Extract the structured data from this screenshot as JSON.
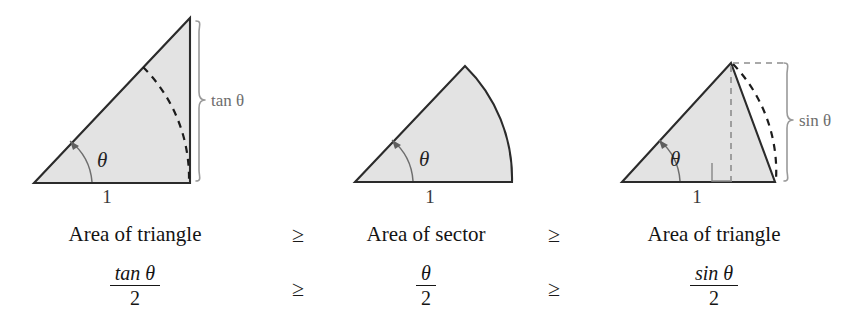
{
  "figure": {
    "title_row": [
      "Area of triangle",
      "Area of sector",
      "Area of triangle"
    ],
    "relations": [
      "≥",
      "≥",
      "≥",
      "≥"
    ],
    "colors": {
      "shape_fill": "#e3e3e3",
      "shape_stroke": "#2b2b2b",
      "brace": "#9a9a9a",
      "dashed_dark": "#1c1c1c",
      "dashed_light": "#8d8d8d",
      "text": "#141414",
      "background": "#ffffff"
    }
  },
  "panels": [
    {
      "id": "tangent-triangle",
      "caption": "Area of triangle",
      "formula": {
        "numerator": "tan θ",
        "denominator": "2"
      },
      "angle_label": "θ",
      "base_label": "1",
      "side_label": "tan θ",
      "shape": "right-triangle-with-unit-arc"
    },
    {
      "id": "circular-sector",
      "caption": "Area of sector",
      "formula": {
        "numerator": "θ",
        "denominator": "2"
      },
      "angle_label": "θ",
      "base_label": "1",
      "side_label": "",
      "shape": "circular-sector"
    },
    {
      "id": "sine-triangle",
      "caption": "Area of triangle",
      "formula": {
        "numerator": "sin θ",
        "denominator": "2"
      },
      "angle_label": "θ",
      "base_label": "1",
      "side_label": "sin θ",
      "shape": "inscribed-triangle-with-altitude"
    }
  ],
  "labels": {
    "tan_theta": "tan θ",
    "sin_theta": "sin θ",
    "theta": "θ",
    "one": "1",
    "two": "2",
    "geq": "≥",
    "area_of_triangle": "Area of triangle",
    "area_of_sector": "Area of sector"
  }
}
